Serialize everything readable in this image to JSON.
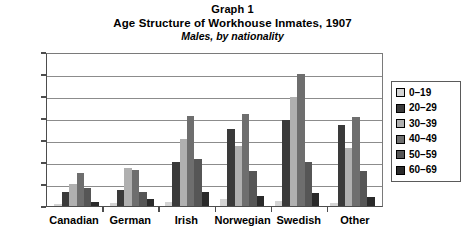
{
  "chart_data": {
    "type": "bar",
    "title": "Graph 1",
    "subtitle": "Age Structure of Workhouse Inmates, 1907",
    "subtitle2": "Males, by nationality",
    "xlabel": "",
    "ylabel": "",
    "ylim": [
      0,
      140
    ],
    "ytick_step": 20,
    "yticks": [
      140,
      120,
      100,
      80,
      60,
      40,
      20,
      0
    ],
    "grid": true,
    "legend_position": "right",
    "categories": [
      "Canadian",
      "German",
      "Irish",
      "Norwegian",
      "Swedish",
      "Other"
    ],
    "series": [
      {
        "name": "0–19",
        "color": "#d4d4d4",
        "values": [
          2,
          3,
          4,
          6,
          5,
          3
        ]
      },
      {
        "name": "20–29",
        "color": "#3a3a3a",
        "values": [
          13,
          15,
          40,
          70,
          78,
          74
        ]
      },
      {
        "name": "30–39",
        "color": "#b0b0b0",
        "values": [
          20,
          35,
          61,
          55,
          99,
          53
        ]
      },
      {
        "name": "40–49",
        "color": "#6e6e6e",
        "values": [
          30,
          33,
          82,
          84,
          120,
          81
        ]
      },
      {
        "name": "50–59",
        "color": "#565656",
        "values": [
          16,
          13,
          43,
          32,
          40,
          32
        ]
      },
      {
        "name": "60–69",
        "color": "#2a2a2a",
        "values": [
          4,
          6,
          13,
          9,
          12,
          8
        ]
      }
    ]
  },
  "legend": {
    "items": [
      {
        "label": "0–19"
      },
      {
        "label": "20–29"
      },
      {
        "label": "30–39"
      },
      {
        "label": "40–49"
      },
      {
        "label": "50–59"
      },
      {
        "label": "60–69"
      }
    ]
  }
}
